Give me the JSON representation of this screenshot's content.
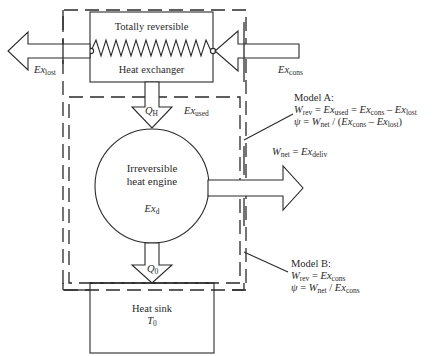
{
  "heat_exchanger": {
    "title_line1": "Totally reversible",
    "title_line2": "Heat exchanger"
  },
  "flows": {
    "ex_lost": {
      "base": "Ex",
      "sub": "lost"
    },
    "ex_cons": {
      "base": "Ex",
      "sub": "cons"
    },
    "q_h": {
      "base": "Q",
      "sub": "H"
    },
    "ex_used": {
      "base": "Ex",
      "sub": "used"
    },
    "q_0": {
      "base": "Q",
      "sub": "0"
    },
    "w_net_deliv": {
      "w": "W",
      "w_sub": "net",
      "eq": " = ",
      "ex": "Ex",
      "ex_sub": "deliv"
    }
  },
  "engine": {
    "line1": "Irreversible",
    "line2": "heat engine",
    "ex_d": {
      "base": "Ex",
      "sub": "d"
    }
  },
  "heat_sink": {
    "line1": "Heat sink",
    "t0": {
      "base": "T",
      "sub": "0"
    }
  },
  "model_a": {
    "title": "Model A:",
    "eq1": {
      "w": "W",
      "w_sub": "rev",
      "p1": " = ",
      "e1": "Ex",
      "e1_sub": "used",
      "p2": " = ",
      "e2": "Ex",
      "e2_sub": "cons",
      "p3": " – ",
      "e3": "Ex",
      "e3_sub": "lost"
    },
    "eq2": {
      "psi": "ψ",
      "p1": " = ",
      "w": "W",
      "w_sub": "net",
      "p2": " / (",
      "e1": "Ex",
      "e1_sub": "cons",
      "p3": " – ",
      "e2": "Ex",
      "e2_sub": "lost",
      "p4": ")"
    }
  },
  "model_b": {
    "title": "Model B:",
    "eq1": {
      "w": "W",
      "w_sub": "rev",
      "p1": " = ",
      "e1": "Ex",
      "e1_sub": "cons"
    },
    "eq2": {
      "psi": "ψ",
      "p1": " = ",
      "w": "W",
      "w_sub": "net",
      "p2": " / ",
      "e1": "Ex",
      "e1_sub": "cons"
    }
  }
}
